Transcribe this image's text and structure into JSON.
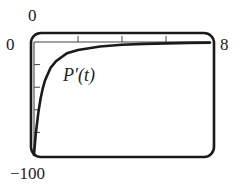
{
  "chart_data": {
    "type": "line",
    "title": "",
    "xlabel": "",
    "ylabel": "",
    "xlim": [
      0,
      8
    ],
    "ylim": [
      -100,
      0
    ],
    "x_tick_step": 2,
    "y_tick_step": 20,
    "grid": false,
    "legend": null,
    "annotations": [
      {
        "text": "P′(t)",
        "x": 1.6,
        "y": -30
      }
    ],
    "series": [
      {
        "name": "P′(t)",
        "x": [
          0.0,
          0.05,
          0.1,
          0.2,
          0.3,
          0.4,
          0.5,
          0.75,
          1.0,
          1.5,
          2.0,
          3.0,
          4.0,
          5.0,
          6.0,
          7.0,
          8.0
        ],
        "values": [
          -100,
          -88,
          -78,
          -62,
          -50,
          -41,
          -34,
          -23,
          -17,
          -10,
          -7,
          -4,
          -2.5,
          -1.7,
          -1.2,
          -0.8,
          -0.5
        ]
      }
    ]
  },
  "labels": {
    "x_min": "0",
    "y_max": "0",
    "x_max": "8",
    "y_min": "−100",
    "curve": "P′(t)"
  }
}
